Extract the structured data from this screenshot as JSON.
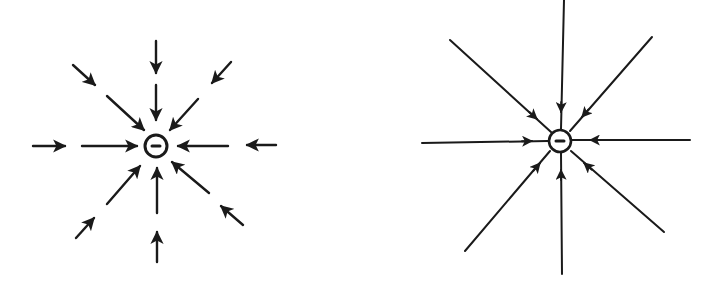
{
  "figure": {
    "panels": [
      {
        "id": "left",
        "representation": "vector-field-arrows",
        "charge": {
          "sign": "-",
          "label": "−",
          "center": [
            156,
            146
          ],
          "radius": 11
        },
        "directions": 8,
        "arrow_direction": "inward",
        "segments": [
          {
            "from": [
              156,
              41
            ],
            "to": [
              156,
              73
            ]
          },
          {
            "from": [
              156,
              85
            ],
            "to": [
              156,
              120
            ]
          },
          {
            "from": [
              33,
              146
            ],
            "to": [
              65,
              146
            ]
          },
          {
            "from": [
              82,
              146
            ],
            "to": [
              137,
              146
            ]
          },
          {
            "from": [
              276,
              145
            ],
            "to": [
              247,
              145
            ]
          },
          {
            "from": [
              228,
              146
            ],
            "to": [
              178,
              146
            ]
          },
          {
            "from": [
              157,
              262
            ],
            "to": [
              157,
              232
            ]
          },
          {
            "from": [
              157,
              213
            ],
            "to": [
              157,
              168
            ]
          },
          {
            "from": [
              73,
              65
            ],
            "to": [
              95,
              85
            ]
          },
          {
            "from": [
              107,
              96
            ],
            "to": [
              144,
              130
            ]
          },
          {
            "from": [
              231,
              62
            ],
            "to": [
              212,
              83
            ]
          },
          {
            "from": [
              198,
              99
            ],
            "to": [
              170,
              130
            ]
          },
          {
            "from": [
              76,
              238
            ],
            "to": [
              94,
              218
            ]
          },
          {
            "from": [
              107,
              204
            ],
            "to": [
              140,
              166
            ]
          },
          {
            "from": [
              243,
              225
            ],
            "to": [
              221,
              206
            ]
          },
          {
            "from": [
              209,
              193
            ],
            "to": [
              172,
              162
            ]
          }
        ]
      },
      {
        "id": "right",
        "representation": "field-lines",
        "charge": {
          "sign": "-",
          "label": "−",
          "center": [
            560,
            141
          ],
          "radius": 11
        },
        "directions": 8,
        "arrow_direction": "inward",
        "lines": [
          {
            "from": [
              564,
              0
            ],
            "to": [
              561,
              129
            ],
            "arrow_at": [
              561,
              112
            ]
          },
          {
            "from": [
              422,
              143
            ],
            "to": [
              548,
              141
            ],
            "arrow_at": [
              532,
              141
            ]
          },
          {
            "from": [
              690,
              140
            ],
            "to": [
              572,
              140
            ],
            "arrow_at": [
              590,
              140
            ]
          },
          {
            "from": [
              562,
              274
            ],
            "to": [
              561,
              153
            ],
            "arrow_at": [
              561,
              170
            ]
          },
          {
            "from": [
              450,
              40
            ],
            "to": [
              551,
              132
            ],
            "arrow_at": [
              537,
              119
            ]
          },
          {
            "from": [
              652,
              37
            ],
            "to": [
              570,
              131
            ],
            "arrow_at": [
              582,
              117
            ]
          },
          {
            "from": [
              465,
              251
            ],
            "to": [
              550,
              151
            ],
            "arrow_at": [
              540,
              163
            ]
          },
          {
            "from": [
              664,
              232
            ],
            "to": [
              571,
              151
            ],
            "arrow_at": [
              584,
              163
            ]
          }
        ]
      }
    ]
  }
}
